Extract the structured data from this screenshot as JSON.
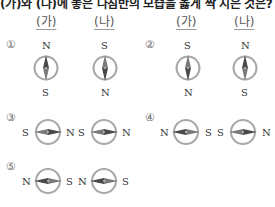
{
  "question": {
    "text": "(가)와 (나)에 놓은 나침반의 모습을 옳게 짝 지은 것은?"
  },
  "headers": [
    "(가)",
    "(나)",
    "(가)",
    "(나)"
  ],
  "options": [
    {
      "number": "①",
      "compasses": [
        {
          "position": "가",
          "orientation": "vertical",
          "top_label": "N",
          "bottom_label": "S"
        },
        {
          "position": "나",
          "orientation": "vertical",
          "top_label": "S",
          "bottom_label": "N"
        }
      ]
    },
    {
      "number": "②",
      "compasses": [
        {
          "position": "가",
          "orientation": "vertical",
          "top_label": "S",
          "bottom_label": "N"
        },
        {
          "position": "나",
          "orientation": "vertical",
          "top_label": "N",
          "bottom_label": "S"
        }
      ]
    },
    {
      "number": "③",
      "compasses": [
        {
          "position": "가",
          "orientation": "horizontal",
          "left_label": "S",
          "right_label": "N"
        },
        {
          "position": "나",
          "orientation": "horizontal",
          "left_label": "S",
          "right_label": "N"
        }
      ]
    },
    {
      "number": "④",
      "compasses": [
        {
          "position": "가",
          "orientation": "horizontal",
          "left_label": "N",
          "right_label": "S"
        },
        {
          "position": "나",
          "orientation": "horizontal",
          "left_label": "S",
          "right_label": "N"
        }
      ]
    },
    {
      "number": "⑤",
      "compasses": [
        {
          "position": "가",
          "orientation": "horizontal",
          "left_label": "N",
          "right_label": "S"
        },
        {
          "position": "나",
          "orientation": "horizontal",
          "left_label": "N",
          "right_label": "S"
        }
      ]
    }
  ],
  "colors": {
    "ring": "#a8a8a8",
    "needle_dark": "#4a4a4a",
    "needle_light": "#8a8a8a"
  }
}
